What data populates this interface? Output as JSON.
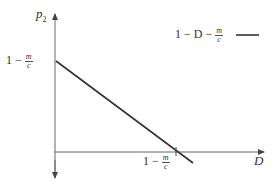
{
  "diagram": {
    "y_axis_label": {
      "var": "p",
      "sub": "2"
    },
    "x_axis_label": "D",
    "y_intercept_label": {
      "lead": "1 −",
      "num": "m",
      "den": "c"
    },
    "x_intercept_label": {
      "lead": "1 −",
      "num": "m",
      "den": "c"
    },
    "legend": {
      "text": "1 − D −",
      "num": "m",
      "den": "c"
    },
    "line_color": "#333333",
    "axis_color": "#555555"
  }
}
